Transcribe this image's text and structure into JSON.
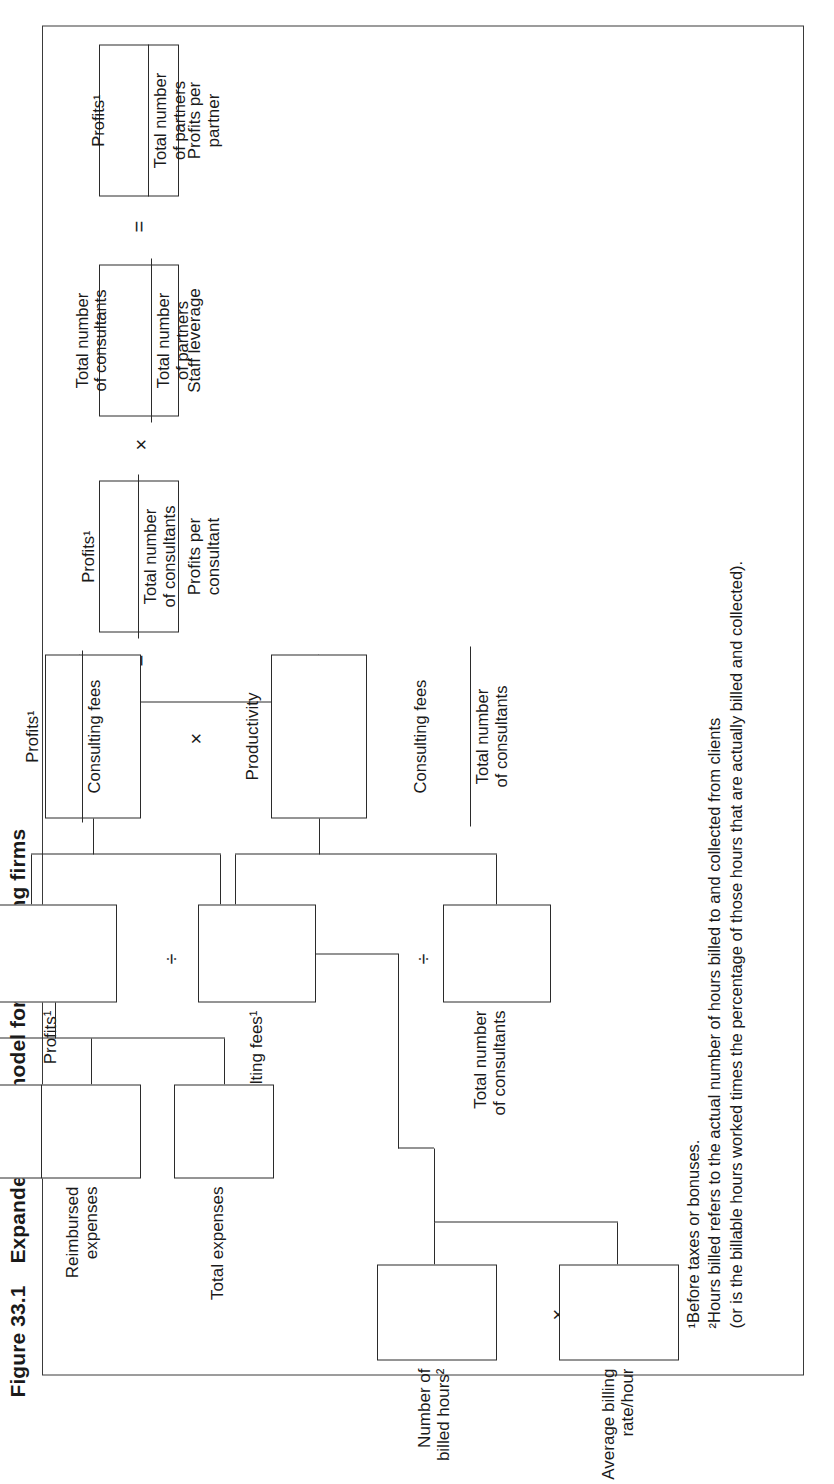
{
  "figure": {
    "number": "Figure 33.1",
    "title": "Expanded profit model for consulting firms"
  },
  "nodes": {
    "profits_per_partner": {
      "box_label": "Profits per\npartner",
      "numerator": "Profits¹",
      "denominator": "Total number\nof partners"
    },
    "staff_leverage": {
      "box_label": "Staff leverage",
      "numerator": "Total number\nof consultants",
      "denominator": "Total number\nof partners"
    },
    "profits_per_consultant": {
      "box_label": "Profits per\nconsultant",
      "numerator": "Profits¹",
      "denominator": "Total number\nof consultants"
    },
    "margin": {
      "box_label": "",
      "numerator": "Profits¹",
      "denominator": "Consulting fees"
    },
    "productivity": {
      "box_label": "Productivity",
      "numerator": "Consulting fees",
      "denominator": "Total number\nof consultants"
    },
    "profits": {
      "box_label": "Profits¹"
    },
    "consulting_fees_1": {
      "box_label": "Consulting fees¹"
    },
    "total_consultants": {
      "box_label": "Total number\nof consultants"
    },
    "consulting_fees": {
      "box_label": "Consulting fees"
    },
    "reimbursed_expenses": {
      "box_label": "Reimbursed\nexpenses"
    },
    "total_expenses": {
      "box_label": "Total expenses"
    },
    "number_billed_hours": {
      "box_label": "Number of\nbilled hours²"
    },
    "avg_billing_rate": {
      "box_label": "Average billing\nrate/hour"
    }
  },
  "operators": {
    "eq_top": "=",
    "times_leverage": "×",
    "eq_consultant": "=",
    "times_margin_productivity": "×",
    "divide_margin": "÷",
    "divide_productivity": "÷",
    "plus_fees": "+",
    "minus_expenses": "−",
    "times_hours": "×"
  },
  "footnotes": [
    "¹Before taxes or bonuses.",
    "²Hours billed refers to the actual number of hours billed to and collected from clients",
    "(or is the billable hours worked times the percentage of those hours that are actually billed and collected)."
  ],
  "colors": {
    "ink": "#1a1a1a",
    "line": "#2b2b2b",
    "frame": "#3a3a3a",
    "background": "#ffffff"
  }
}
